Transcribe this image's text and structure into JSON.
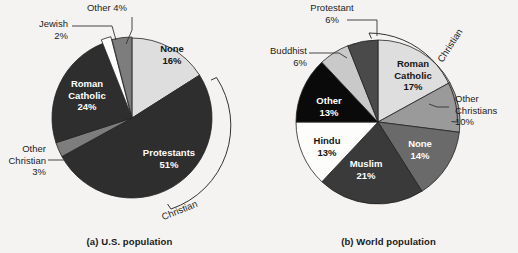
{
  "figure": {
    "background": "#f4f3f1",
    "panels": [
      "us",
      "world"
    ]
  },
  "palette": {
    "black": "#0a0a0a",
    "dark_charcoal": "#2e2e2e",
    "dark_gray": "#4a4a4a",
    "mid_gray": "#7d7d7d",
    "light_gray": "#c9c9c9",
    "pale_gray": "#dedede",
    "white": "#fdfdfb",
    "outline": "#222222",
    "text": "#1d1d1d",
    "text_on_dark": "#ffffff"
  },
  "chart_data": [
    {
      "type": "pie",
      "id": "us",
      "title": "(a) U.S. population",
      "xlabel": "",
      "ylabel": "",
      "legend": "none",
      "start_angle_deg": -90,
      "direction": "clockwise",
      "bracket_label": "Christian",
      "bracket_covers": [
        "Protestants",
        "Other Christian",
        "Roman Catholic"
      ],
      "categories": [
        "None",
        "Protestants",
        "Other Christian",
        "Roman Catholic",
        "Jewish",
        "Other"
      ],
      "values": [
        16,
        51,
        3,
        24,
        2,
        4
      ],
      "labels": [
        "16%",
        "51%",
        "3%",
        "24%",
        "2%",
        "4%"
      ],
      "slices": [
        {
          "name": "None",
          "value": 16,
          "pct": "16%",
          "fill": "#dedede",
          "label_place": "inside",
          "text_tone": "on-light"
        },
        {
          "name": "Protestants",
          "value": 51,
          "pct": "51%",
          "fill": "#2e2e2e",
          "label_place": "inside",
          "text_tone": "on-dark"
        },
        {
          "name": "Other Christian",
          "value": 3,
          "pct": "3%",
          "fill": "#7d7d7d",
          "label_place": "outside",
          "text_tone": "on-light"
        },
        {
          "name": "Roman Catholic",
          "value": 24,
          "pct": "24%",
          "fill": "#2e2e2e",
          "label_place": "inside",
          "text_tone": "on-dark"
        },
        {
          "name": "Jewish",
          "value": 2,
          "pct": "2%",
          "fill": "#fdfdfb",
          "label_place": "outside",
          "text_tone": "on-light"
        },
        {
          "name": "Other",
          "value": 4,
          "pct": "4%",
          "fill": "#7d7d7d",
          "label_place": "outside",
          "text_tone": "on-light"
        }
      ]
    },
    {
      "type": "pie",
      "id": "world",
      "title": "(b) World population",
      "xlabel": "",
      "ylabel": "",
      "legend": "none",
      "start_angle_deg": -90,
      "direction": "clockwise",
      "bracket_label": "Christian",
      "bracket_covers": [
        "Roman Catholic",
        "Other Christians"
      ],
      "categories": [
        "Roman Catholic",
        "Other Christians",
        "None",
        "Muslim",
        "Hindu",
        "Other",
        "Buddhist",
        "Protestant"
      ],
      "values": [
        17,
        10,
        14,
        21,
        13,
        13,
        6,
        6
      ],
      "labels": [
        "17%",
        "10%",
        "14%",
        "21%",
        "13%",
        "13%",
        "6%",
        "6%"
      ],
      "slices": [
        {
          "name": "Roman Catholic",
          "value": 17,
          "pct": "17%",
          "fill": "#dedede",
          "label_place": "inside",
          "text_tone": "on-light"
        },
        {
          "name": "Other Christians",
          "value": 10,
          "pct": "10%",
          "fill": "#9a9a9a",
          "label_place": "outside",
          "text_tone": "on-light"
        },
        {
          "name": "None",
          "value": 14,
          "pct": "14%",
          "fill": "#6a6a6a",
          "label_place": "inside",
          "text_tone": "on-dark"
        },
        {
          "name": "Muslim",
          "value": 21,
          "pct": "21%",
          "fill": "#3a3a3a",
          "label_place": "inside",
          "text_tone": "on-dark"
        },
        {
          "name": "Hindu",
          "value": 13,
          "pct": "13%",
          "fill": "#fdfdfb",
          "label_place": "inside",
          "text_tone": "on-light"
        },
        {
          "name": "Other",
          "value": 13,
          "pct": "13%",
          "fill": "#0a0a0a",
          "label_place": "inside",
          "text_tone": "on-dark"
        },
        {
          "name": "Buddhist",
          "value": 6,
          "pct": "6%",
          "fill": "#c9c9c9",
          "label_place": "outside",
          "text_tone": "on-light"
        },
        {
          "name": "Protestant",
          "value": 6,
          "pct": "6%",
          "fill": "#4a4a4a",
          "label_place": "outside",
          "text_tone": "on-light"
        }
      ]
    }
  ],
  "us": {
    "caption": "(a) U.S. population",
    "arc_label": "Christian",
    "callouts": {
      "other": {
        "name": "Other 4%",
        "line1": "Other 4%",
        "line2": ""
      },
      "jewish": {
        "name": "Jewish 2%",
        "line1": "Jewish",
        "line2": "2%"
      },
      "other_christian": {
        "name": "Other Christian 3%",
        "line1": "Other",
        "line2": "Christian",
        "line3": "3%"
      }
    },
    "inside_labels": {
      "none": {
        "line1": "None",
        "line2": "16%"
      },
      "protestants": {
        "line1": "Protestants",
        "line2": "51%"
      },
      "roman_catholic": {
        "line1": "Roman",
        "line2": "Catholic",
        "line3": "24%"
      }
    }
  },
  "world": {
    "caption": "(b) World population",
    "arc_label": "Christian",
    "callouts": {
      "protestant": {
        "line1": "Protestant",
        "line2": "6%"
      },
      "buddhist": {
        "line1": "Buddhist",
        "line2": "6%"
      },
      "other_christians": {
        "line1": "Other",
        "line2": "Christians",
        "line3": "10%"
      }
    },
    "inside_labels": {
      "roman_catholic": {
        "line1": "Roman",
        "line2": "Catholic",
        "line3": "17%"
      },
      "none": {
        "line1": "None",
        "line2": "14%"
      },
      "muslim": {
        "line1": "Muslim",
        "line2": "21%"
      },
      "hindu": {
        "line1": "Hindu",
        "line2": "13%"
      },
      "other": {
        "line1": "Other",
        "line2": "13%"
      }
    }
  }
}
